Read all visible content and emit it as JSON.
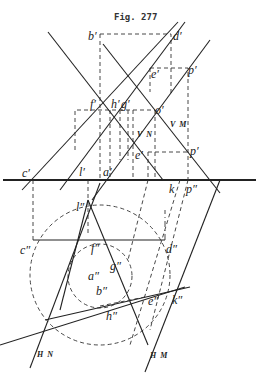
{
  "figure": {
    "title": "Fig. 277",
    "labels": {
      "b_prime": "b′",
      "d_prime": "d′",
      "e_prime_top": "e′",
      "p_prime_top": "p′",
      "f_prime": "f′",
      "h_prime": "h′",
      "g_prime": "g′",
      "o_prime": "o′",
      "vn": "V N",
      "vm": "V M",
      "e_prime": "e′",
      "p_prime": "p′",
      "c_prime": "c′",
      "l_prime": "l′",
      "a_prime": "a′",
      "k": "k",
      "p_dprime": "p″",
      "l_dprime": "l″",
      "c_dprime": "c″",
      "f_dprime": "f″",
      "d_dprime": "d″",
      "a_dprime": "a″",
      "g_dprime": "g″",
      "b_dprime": "b″",
      "e_dprime": "e″",
      "k_dprime": "k″",
      "h_dprime": "h″",
      "hn": "H N",
      "hm": "H M"
    }
  }
}
